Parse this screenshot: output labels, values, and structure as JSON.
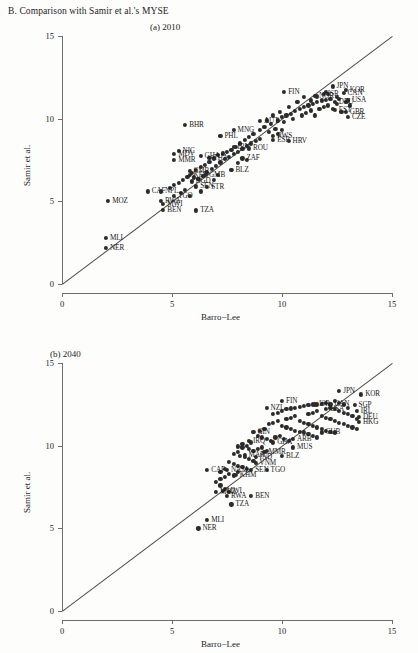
{
  "figure": {
    "title": "B.  Comparison with Samir et al.'s MYSE",
    "panels": [
      {
        "caption": "(a)  2010"
      },
      {
        "caption": "(b)  2040"
      }
    ]
  },
  "chart_data": [
    {
      "type": "scatter",
      "title": "(a)  2010",
      "xlabel": "Barro−Lee",
      "ylabel": "Samir et al.",
      "xlim": [
        0,
        15
      ],
      "ylim": [
        0,
        15
      ],
      "xticks": [
        0,
        5,
        10,
        15
      ],
      "yticks": [
        0,
        5,
        10,
        15
      ],
      "grid": false,
      "legend": "none",
      "annotations": [
        "45-degree reference line from (0,0) to (15,15)"
      ],
      "labeled_points": [
        {
          "label": "NER",
          "x": 2.0,
          "y": 2.2
        },
        {
          "label": "MLI",
          "x": 2.0,
          "y": 2.8
        },
        {
          "label": "MOZ",
          "x": 2.1,
          "y": 5.05
        },
        {
          "label": "BEN",
          "x": 4.6,
          "y": 4.5
        },
        {
          "label": "TZA",
          "x": 6.1,
          "y": 4.45
        },
        {
          "label": "MWI",
          "x": 4.6,
          "y": 4.85
        },
        {
          "label": "RWA",
          "x": 4.5,
          "y": 5.05
        },
        {
          "label": "CAF",
          "x": 3.9,
          "y": 5.6
        },
        {
          "label": "NPL",
          "x": 4.5,
          "y": 5.6
        },
        {
          "label": "TGO",
          "x": 5.1,
          "y": 5.35
        },
        {
          "label": "MMR",
          "x": 5.1,
          "y": 7.5
        },
        {
          "label": "CMR",
          "x": 5.8,
          "y": 6.85
        },
        {
          "label": "KEN",
          "x": 5.8,
          "y": 6.6
        },
        {
          "label": "GMB",
          "x": 6.5,
          "y": 6.6
        },
        {
          "label": "BGD",
          "x": 5.9,
          "y": 6.2
        },
        {
          "label": "SEN",
          "x": 6.1,
          "y": 5.9
        },
        {
          "label": "STR",
          "x": 6.6,
          "y": 5.85
        },
        {
          "label": "NIC",
          "x": 5.3,
          "y": 8.05
        },
        {
          "label": "MDV",
          "x": 5.1,
          "y": 7.85
        },
        {
          "label": "BHR",
          "x": 5.6,
          "y": 9.6
        },
        {
          "label": "PHL",
          "x": 7.2,
          "y": 8.95
        },
        {
          "label": "MNG",
          "x": 7.8,
          "y": 9.3
        },
        {
          "label": "AUT",
          "x": 9.0,
          "y": 9.85
        },
        {
          "label": "THA",
          "x": 6.7,
          "y": 7.65
        },
        {
          "label": "GHA",
          "x": 6.3,
          "y": 7.75
        },
        {
          "label": "ZAF",
          "x": 8.2,
          "y": 7.6
        },
        {
          "label": "BLZ",
          "x": 7.7,
          "y": 6.9
        },
        {
          "label": "IRN",
          "x": 7.8,
          "y": 8.3
        },
        {
          "label": "ROU",
          "x": 8.5,
          "y": 8.2
        },
        {
          "label": "ESP",
          "x": 9.6,
          "y": 8.7
        },
        {
          "label": "HRV",
          "x": 10.3,
          "y": 8.65
        },
        {
          "label": "RWS",
          "x": 9.6,
          "y": 8.95
        },
        {
          "label": "FIN",
          "x": 10.1,
          "y": 11.6
        },
        {
          "label": "JPN",
          "x": 12.3,
          "y": 11.95
        },
        {
          "label": "KOR",
          "x": 12.9,
          "y": 11.75
        },
        {
          "label": "CAN",
          "x": 12.8,
          "y": 11.55
        },
        {
          "label": "ISR",
          "x": 11.9,
          "y": 11.5
        },
        {
          "label": "USA",
          "x": 13.0,
          "y": 11.1
        },
        {
          "label": "GBR",
          "x": 12.9,
          "y": 10.4
        },
        {
          "label": "CZE",
          "x": 13.0,
          "y": 10.1
        },
        {
          "label": "NOR",
          "x": 11.5,
          "y": 11.4
        },
        {
          "label": "DEU",
          "x": 12.4,
          "y": 11.0
        },
        {
          "label": "EST",
          "x": 12.4,
          "y": 10.55
        }
      ],
      "cluster_points": [
        [
          9.2,
          9.5
        ],
        [
          9.5,
          9.7
        ],
        [
          9.8,
          9.9
        ],
        [
          10.0,
          10.1
        ],
        [
          10.2,
          10.2
        ],
        [
          10.4,
          10.3
        ],
        [
          10.6,
          10.45
        ],
        [
          10.8,
          10.6
        ],
        [
          11.0,
          10.7
        ],
        [
          11.2,
          10.8
        ],
        [
          11.4,
          10.9
        ],
        [
          11.6,
          11.0
        ],
        [
          11.8,
          11.1
        ],
        [
          12.0,
          11.15
        ],
        [
          12.2,
          11.2
        ],
        [
          10.9,
          10.2
        ],
        [
          11.1,
          10.35
        ],
        [
          11.3,
          10.5
        ],
        [
          11.5,
          10.2
        ],
        [
          11.7,
          10.6
        ],
        [
          11.9,
          10.7
        ],
        [
          12.1,
          10.8
        ],
        [
          12.3,
          10.6
        ],
        [
          12.5,
          10.9
        ],
        [
          12.7,
          10.4
        ],
        [
          12.5,
          11.3
        ],
        [
          12.1,
          11.5
        ],
        [
          11.3,
          11.1
        ],
        [
          10.7,
          11.0
        ],
        [
          10.3,
          10.7
        ],
        [
          9.9,
          10.4
        ],
        [
          9.6,
          10.2
        ],
        [
          9.3,
          9.9
        ],
        [
          9.0,
          9.3
        ],
        [
          8.7,
          9.1
        ],
        [
          8.5,
          8.9
        ],
        [
          8.3,
          8.7
        ],
        [
          8.1,
          8.5
        ],
        [
          7.9,
          8.3
        ],
        [
          7.7,
          8.1
        ],
        [
          7.5,
          8.0
        ],
        [
          7.3,
          7.9
        ],
        [
          7.1,
          7.8
        ],
        [
          6.9,
          7.6
        ],
        [
          6.7,
          7.4
        ],
        [
          6.5,
          7.2
        ],
        [
          6.3,
          7.1
        ],
        [
          6.1,
          6.9
        ],
        [
          5.9,
          6.7
        ],
        [
          5.7,
          6.5
        ],
        [
          5.5,
          6.3
        ],
        [
          5.3,
          6.1
        ],
        [
          5.1,
          6.0
        ],
        [
          4.9,
          5.8
        ],
        [
          6.0,
          6.45
        ],
        [
          6.2,
          6.35
        ],
        [
          6.4,
          6.55
        ],
        [
          6.6,
          6.75
        ],
        [
          6.8,
          6.95
        ],
        [
          7.0,
          7.15
        ],
        [
          7.2,
          7.35
        ],
        [
          7.4,
          7.55
        ],
        [
          7.6,
          7.7
        ],
        [
          7.8,
          7.85
        ],
        [
          8.0,
          8.0
        ],
        [
          8.2,
          8.15
        ],
        [
          8.4,
          8.35
        ],
        [
          8.6,
          8.5
        ],
        [
          8.8,
          8.65
        ],
        [
          9.0,
          8.8
        ],
        [
          9.4,
          9.2
        ],
        [
          9.7,
          9.4
        ],
        [
          10.1,
          9.8
        ],
        [
          10.5,
          10.0
        ],
        [
          11.0,
          11.3
        ],
        [
          11.6,
          11.35
        ],
        [
          12.0,
          11.6
        ],
        [
          12.6,
          11.2
        ],
        [
          13.1,
          10.8
        ],
        [
          12.9,
          11.0
        ],
        [
          10.0,
          9.3
        ],
        [
          9.8,
          9.1
        ],
        [
          5.4,
          5.5
        ],
        [
          5.6,
          5.7
        ],
        [
          5.8,
          5.35
        ],
        [
          6.3,
          5.6
        ],
        [
          6.9,
          6.3
        ],
        [
          7.1,
          6.6
        ],
        [
          8.0,
          7.3
        ],
        [
          8.4,
          7.5
        ]
      ]
    },
    {
      "type": "scatter",
      "title": "(b)  2040",
      "xlabel": "Barro−Lee",
      "ylabel": "Samir et al.",
      "xlim": [
        0,
        15
      ],
      "ylim": [
        0,
        15
      ],
      "xticks": [
        0,
        5,
        10,
        15
      ],
      "yticks": [
        0,
        5,
        10,
        15
      ],
      "grid": false,
      "legend": "none",
      "annotations": [
        "45-degree reference line from (0,0) to (15,15)"
      ],
      "labeled_points": [
        {
          "label": "NER",
          "x": 6.2,
          "y": 5.0
        },
        {
          "label": "MLI",
          "x": 6.6,
          "y": 5.5
        },
        {
          "label": "TZA",
          "x": 7.7,
          "y": 6.45
        },
        {
          "label": "RWA",
          "x": 7.5,
          "y": 6.95
        },
        {
          "label": "MWI",
          "x": 7.3,
          "y": 7.25
        },
        {
          "label": "BEN",
          "x": 8.6,
          "y": 6.95
        },
        {
          "label": "MOZ",
          "x": 7.0,
          "y": 7.2
        },
        {
          "label": "CAF",
          "x": 6.6,
          "y": 8.55
        },
        {
          "label": "NAM",
          "x": 7.5,
          "y": 8.55
        },
        {
          "label": "KHM",
          "x": 7.9,
          "y": 8.25
        },
        {
          "label": "SEN",
          "x": 8.6,
          "y": 8.55
        },
        {
          "label": "TGO",
          "x": 9.3,
          "y": 8.55
        },
        {
          "label": "VNM",
          "x": 8.8,
          "y": 8.95
        },
        {
          "label": "IND",
          "x": 8.8,
          "y": 9.3
        },
        {
          "label": "MAR",
          "x": 8.3,
          "y": 9.45
        },
        {
          "label": "MMR",
          "x": 9.2,
          "y": 9.6
        },
        {
          "label": "BLZ",
          "x": 10.0,
          "y": 9.4
        },
        {
          "label": "MUS",
          "x": 10.5,
          "y": 9.9
        },
        {
          "label": "GHA",
          "x": 9.6,
          "y": 10.2
        },
        {
          "label": "ARB",
          "x": 10.5,
          "y": 10.4
        },
        {
          "label": "IRQ",
          "x": 8.5,
          "y": 10.3
        },
        {
          "label": "GIN",
          "x": 8.7,
          "y": 10.85
        },
        {
          "label": "CUB",
          "x": 11.8,
          "y": 10.8
        },
        {
          "label": "NZL",
          "x": 9.3,
          "y": 12.3
        },
        {
          "label": "FIN",
          "x": 10.0,
          "y": 12.7
        },
        {
          "label": "JPN",
          "x": 12.6,
          "y": 13.3
        },
        {
          "label": "KOR",
          "x": 13.6,
          "y": 13.1
        },
        {
          "label": "CAN",
          "x": 12.2,
          "y": 12.5
        },
        {
          "label": "SGP",
          "x": 13.3,
          "y": 12.45
        },
        {
          "label": "IRL",
          "x": 13.4,
          "y": 12.1
        },
        {
          "label": "DEU",
          "x": 13.5,
          "y": 11.75
        },
        {
          "label": "HKG",
          "x": 13.5,
          "y": 11.45
        },
        {
          "label": "ISR",
          "x": 11.5,
          "y": 12.5
        },
        {
          "label": "USA",
          "x": 12.0,
          "y": 12.2
        }
      ],
      "cluster_points": [
        [
          9.6,
          11.9
        ],
        [
          9.8,
          12.0
        ],
        [
          10.0,
          12.1
        ],
        [
          10.2,
          12.2
        ],
        [
          10.4,
          12.25
        ],
        [
          10.6,
          12.3
        ],
        [
          10.8,
          12.35
        ],
        [
          11.0,
          12.4
        ],
        [
          11.2,
          12.45
        ],
        [
          11.4,
          12.5
        ],
        [
          11.6,
          12.5
        ],
        [
          11.8,
          12.55
        ],
        [
          12.0,
          12.6
        ],
        [
          12.2,
          12.3
        ],
        [
          12.4,
          12.2
        ],
        [
          12.6,
          12.1
        ],
        [
          12.8,
          12.0
        ],
        [
          13.0,
          11.9
        ],
        [
          13.2,
          11.8
        ],
        [
          13.4,
          11.6
        ],
        [
          13.0,
          12.3
        ],
        [
          12.8,
          12.5
        ],
        [
          12.6,
          12.6
        ],
        [
          12.4,
          12.7
        ],
        [
          11.2,
          11.9
        ],
        [
          11.4,
          12.0
        ],
        [
          11.6,
          12.1
        ],
        [
          11.8,
          11.8
        ],
        [
          12.0,
          11.7
        ],
        [
          12.2,
          11.6
        ],
        [
          12.4,
          11.5
        ],
        [
          12.6,
          11.4
        ],
        [
          12.8,
          11.3
        ],
        [
          13.0,
          11.2
        ],
        [
          13.2,
          11.1
        ],
        [
          13.4,
          11.0
        ],
        [
          10.2,
          11.6
        ],
        [
          10.4,
          11.7
        ],
        [
          10.6,
          11.8
        ],
        [
          10.8,
          11.5
        ],
        [
          11.0,
          11.4
        ],
        [
          11.2,
          11.3
        ],
        [
          11.4,
          11.2
        ],
        [
          11.6,
          11.1
        ],
        [
          11.8,
          11.0
        ],
        [
          12.0,
          10.9
        ],
        [
          12.2,
          10.85
        ],
        [
          12.4,
          10.8
        ],
        [
          9.4,
          11.3
        ],
        [
          9.6,
          11.4
        ],
        [
          9.8,
          11.5
        ],
        [
          10.0,
          11.2
        ],
        [
          10.2,
          11.1
        ],
        [
          10.4,
          11.0
        ],
        [
          10.6,
          10.9
        ],
        [
          10.8,
          10.85
        ],
        [
          11.0,
          10.8
        ],
        [
          11.2,
          10.7
        ],
        [
          11.4,
          10.6
        ],
        [
          11.6,
          10.5
        ],
        [
          9.0,
          10.9
        ],
        [
          9.2,
          11.0
        ],
        [
          8.9,
          10.6
        ],
        [
          9.1,
          10.5
        ],
        [
          9.3,
          10.4
        ],
        [
          9.5,
          10.3
        ],
        [
          9.7,
          10.5
        ],
        [
          9.9,
          10.6
        ],
        [
          10.1,
          10.4
        ],
        [
          10.3,
          10.3
        ],
        [
          8.6,
          10.2
        ],
        [
          8.4,
          10.0
        ],
        [
          8.2,
          9.9
        ],
        [
          8.5,
          9.8
        ],
        [
          8.7,
          9.7
        ],
        [
          8.9,
          9.8
        ],
        [
          9.1,
          9.9
        ],
        [
          9.3,
          9.7
        ],
        [
          8.0,
          9.6
        ],
        [
          7.8,
          9.5
        ],
        [
          8.1,
          9.4
        ],
        [
          8.3,
          9.3
        ],
        [
          8.5,
          9.2
        ],
        [
          8.7,
          9.1
        ],
        [
          7.6,
          9.0
        ],
        [
          7.8,
          8.9
        ],
        [
          8.0,
          8.8
        ],
        [
          8.2,
          8.7
        ],
        [
          8.4,
          8.6
        ],
        [
          8.0,
          8.4
        ],
        [
          7.4,
          8.6
        ],
        [
          7.2,
          8.4
        ],
        [
          7.6,
          8.3
        ],
        [
          7.8,
          8.2
        ],
        [
          7.4,
          8.1
        ],
        [
          7.2,
          8.0
        ],
        [
          7.0,
          7.8
        ],
        [
          7.2,
          7.6
        ],
        [
          7.4,
          7.4
        ],
        [
          7.6,
          7.2
        ],
        [
          8.0,
          9.95
        ],
        [
          8.2,
          10.1
        ]
      ]
    }
  ]
}
